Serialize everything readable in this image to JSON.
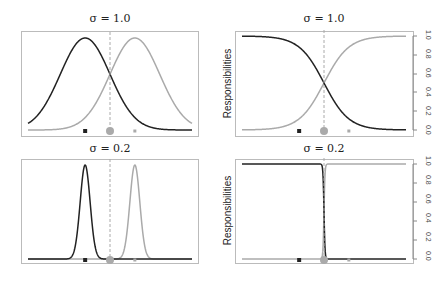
{
  "chart_data": [
    {
      "type": "line",
      "panel": "top-left",
      "title": "σ = 1.0",
      "xlabel": "",
      "ylabel": "",
      "series": [
        {
          "name": "Gaussian 1 (dark)",
          "color": "#222222",
          "mean": -1.0,
          "sd": 1.0
        },
        {
          "name": "Gaussian 2 (light)",
          "color": "#aaaaaa",
          "mean": 1.0,
          "sd": 1.0
        }
      ],
      "markers": [
        {
          "name": "component 1 center",
          "x": -1.0,
          "shape": "square",
          "color": "#222222"
        },
        {
          "name": "data point",
          "x": 0.0,
          "shape": "circle",
          "color": "#aaaaaa",
          "size": "large"
        },
        {
          "name": "component 2 center",
          "x": 1.0,
          "shape": "square",
          "color": "#aaaaaa"
        }
      ],
      "vline": {
        "x": 0.0,
        "style": "dashed",
        "color": "#aaaaaa"
      }
    },
    {
      "type": "line",
      "panel": "top-right",
      "title": "σ = 1.0",
      "ylabel": "Responsibilities",
      "ylim": [
        0.0,
        1.0
      ],
      "yticks": [
        "0.0",
        "0.2",
        "0.4",
        "0.6",
        "0.8",
        "1.0"
      ],
      "series": [
        {
          "name": "Responsibility 1 (dark)",
          "color": "#222222",
          "shape": "decreasing sigmoid",
          "scale": 1.0
        },
        {
          "name": "Responsibility 2 (light)",
          "color": "#aaaaaa",
          "shape": "increasing sigmoid",
          "scale": 1.0
        }
      ],
      "vline": {
        "x": 0.0,
        "style": "dashed",
        "color": "#aaaaaa"
      }
    },
    {
      "type": "line",
      "panel": "bottom-left",
      "title": "σ = 0.2",
      "series": [
        {
          "name": "Gaussian 1 (dark)",
          "color": "#222222",
          "mean": -1.0,
          "sd": 0.2
        },
        {
          "name": "Gaussian 2 (light)",
          "color": "#aaaaaa",
          "mean": 1.0,
          "sd": 0.2
        }
      ],
      "vline": {
        "x": 0.0,
        "style": "dashed",
        "color": "#aaaaaa"
      }
    },
    {
      "type": "line",
      "panel": "bottom-right",
      "title": "σ = 0.2",
      "ylabel": "Responsibilities",
      "ylim": [
        0.0,
        1.0
      ],
      "yticks": [
        "0.0",
        "0.2",
        "0.4",
        "0.6",
        "0.8",
        "1.0"
      ],
      "series": [
        {
          "name": "Responsibility 1 (dark)",
          "color": "#222222",
          "shape": "step down"
        },
        {
          "name": "Responsibility 2 (light)",
          "color": "#aaaaaa",
          "shape": "step up"
        }
      ],
      "vline": {
        "x": 0.0,
        "style": "dashed",
        "color": "#aaaaaa"
      }
    }
  ],
  "labels": {
    "tl_title": "σ = 1.0",
    "tr_title": "σ = 1.0",
    "bl_title": "σ = 0.2",
    "br_title": "σ = 0.2",
    "ylabel": "Responsibilities",
    "yticks": [
      "0.0",
      "0.2",
      "0.4",
      "0.6",
      "0.8",
      "1.0"
    ]
  }
}
